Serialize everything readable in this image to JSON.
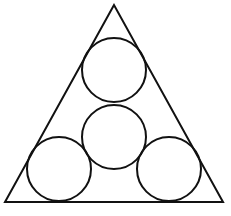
{
  "diagram": {
    "stroke_color": "#111111",
    "background": "#ffffff",
    "triangle": {
      "apex": [
        114,
        5
      ],
      "base_left": [
        5,
        202
      ],
      "base_right": [
        223,
        202
      ]
    },
    "circles": [
      {
        "name": "top",
        "cx": 114,
        "cy": 70,
        "r": 32
      },
      {
        "name": "middle",
        "cx": 114,
        "cy": 137,
        "r": 32
      },
      {
        "name": "bottom-left",
        "cx": 59,
        "cy": 169,
        "r": 32
      },
      {
        "name": "bottom-right",
        "cx": 169,
        "cy": 169,
        "r": 32
      }
    ]
  }
}
